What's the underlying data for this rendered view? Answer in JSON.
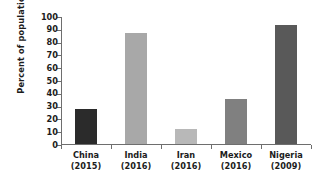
{
  "chart_data": {
    "type": "bar",
    "title": "",
    "xlabel": "",
    "ylabel": "Percent of population",
    "categories": [
      "China",
      "India",
      "Iran",
      "Mexico",
      "Nigeria"
    ],
    "category_years": [
      "(2015)",
      "(2016)",
      "(2016)",
      "(2016)",
      "(2009)"
    ],
    "category_labels": [
      "China (2015)",
      "India (2016)",
      "Iran (2016)",
      "Mexico (2016)",
      "Nigeria (2009)"
    ],
    "values": [
      27,
      87,
      12,
      35,
      93
    ],
    "ylim": [
      0,
      100
    ],
    "ytick_labels": [
      "0",
      "10",
      "20",
      "30",
      "40",
      "50",
      "60",
      "70",
      "80",
      "90",
      "100"
    ],
    "ytick_values": [
      0,
      10,
      20,
      30,
      40,
      50,
      60,
      70,
      80,
      90,
      100
    ],
    "grid": false,
    "legend": "none",
    "bar_colors": [
      "#2b2b2b",
      "#a8a8a8",
      "#b8b8b8",
      "#808080",
      "#595959"
    ],
    "axis_color": "#6e6e6e",
    "text_color": "#1c1c1c",
    "background": "#ffffff"
  },
  "figure": {
    "title_remnant": ""
  }
}
